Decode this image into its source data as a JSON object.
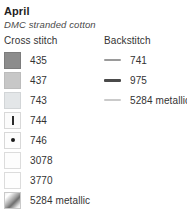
{
  "header": {
    "title": "April",
    "subtitle": "DMC stranded cotton"
  },
  "cross_stitch": {
    "heading": "Cross stitch",
    "items": [
      {
        "code": "435",
        "fill": "#8c8c8c",
        "border": "#7c7c7c",
        "symbol": "none"
      },
      {
        "code": "437",
        "fill": "#c7c7c7",
        "border": "#bcbcbc",
        "symbol": "none"
      },
      {
        "code": "743",
        "fill": "#e3e6e8",
        "border": "#d2d5d7",
        "symbol": "none"
      },
      {
        "code": "744",
        "fill": "#fbfbfb",
        "border": "#d8d8d8",
        "symbol": "vertical-bar"
      },
      {
        "code": "746",
        "fill": "#fdfdfd",
        "border": "#d8d8d8",
        "symbol": "center-dot"
      },
      {
        "code": "3078",
        "fill": "#fdfdfd",
        "border": "#dcdcdc",
        "symbol": "none"
      },
      {
        "code": "3770",
        "fill": "#fefefe",
        "border": "#dcdcdc",
        "symbol": "none"
      },
      {
        "code": "5284 metallic",
        "fill": "gradient",
        "border": "#c9c9c9",
        "symbol": "none"
      }
    ]
  },
  "backstitch": {
    "heading": "Backstitch",
    "items": [
      {
        "code": "741",
        "color": "#9a9a9a",
        "thickness": "2px"
      },
      {
        "code": "975",
        "color": "#4a4a4a",
        "thickness": "3px"
      },
      {
        "code": "5284 metallic",
        "color": "#cacaca",
        "thickness": "2px"
      }
    ]
  }
}
